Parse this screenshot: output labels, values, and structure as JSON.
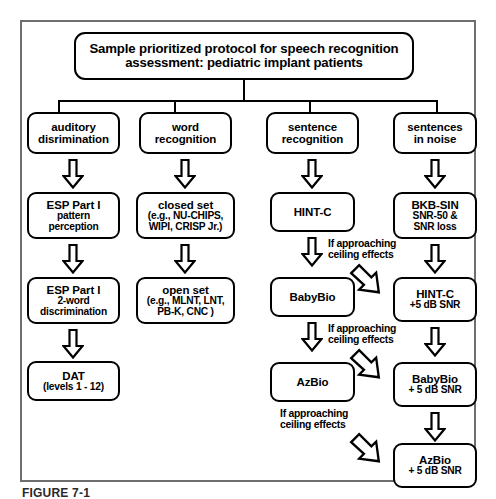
{
  "figure": {
    "title_line1": "Sample prioritized protocol for speech recognition",
    "title_line2": "assessment: pediatric implant patients",
    "caption": "FIGURE 7-1",
    "border_color": "#6f6f6f"
  },
  "columns": [
    {
      "header": {
        "line1": "auditory",
        "line2": "disrimination"
      },
      "nodes": [
        {
          "line1": "ESP Part I",
          "line2": "pattern",
          "line3": "perception"
        },
        {
          "line1": "ESP Part I",
          "line2": "2-word",
          "line3": "discrimination"
        },
        {
          "line1": "DAT",
          "line2": "(levels 1 - 12)",
          "line3": ""
        }
      ]
    },
    {
      "header": {
        "line1": "word",
        "line2": "recognition"
      },
      "nodes": [
        {
          "line1": "closed set",
          "line2": "(e.g., NU-CHIPS,",
          "line3": "WIPI, CRISP Jr.)"
        },
        {
          "line1": "open set",
          "line2": "(e.g., MLNT, LNT,",
          "line3": "PB-K, CNC )"
        }
      ]
    },
    {
      "header": {
        "line1": "sentence",
        "line2": "recognition"
      },
      "nodes": [
        {
          "line1": "HINT-C",
          "line2": "",
          "line3": ""
        },
        {
          "line1": "BabyBio",
          "line2": "",
          "line3": ""
        },
        {
          "line1": "AzBio",
          "line2": "",
          "line3": ""
        }
      ]
    },
    {
      "header": {
        "line1": "sentences",
        "line2": "in noise"
      },
      "nodes": [
        {
          "line1": "BKB-SIN",
          "line2": "SNR-50 &",
          "line3": "SNR loss"
        },
        {
          "line1": "HINT-C",
          "line2": "+5 dB SNR",
          "line3": ""
        },
        {
          "line1": "BabyBio",
          "line2": "+ 5 dB SNR",
          "line3": ""
        },
        {
          "line1": "AzBio",
          "line2": "+ 5 dB SNR",
          "line3": ""
        }
      ]
    }
  ],
  "notes": [
    {
      "line1": "If approaching",
      "line2": "ceiling effects"
    },
    {
      "line1": "If approaching",
      "line2": "ceiling effects"
    },
    {
      "line1": "If approaching",
      "line2": "ceiling effects"
    }
  ]
}
